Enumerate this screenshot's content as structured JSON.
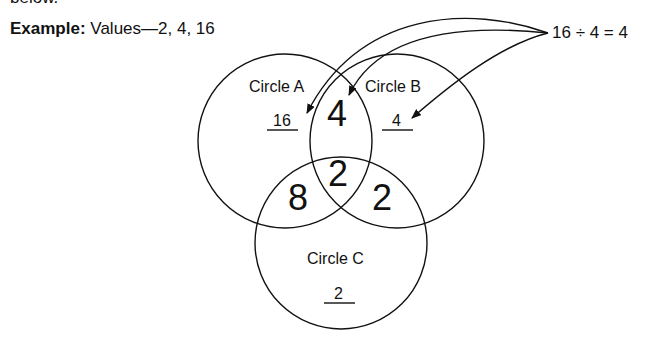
{
  "header": {
    "cut_text": "below.",
    "example_label": "Example:",
    "example_values": "Values—2, 4, 16"
  },
  "equation": "16 ÷ 4 = 4",
  "circles": [
    {
      "name": "Circle A",
      "value": "16"
    },
    {
      "name": "Circle B",
      "value": "4"
    },
    {
      "name": "Circle C",
      "value": "2"
    }
  ],
  "intersections": {
    "AB": "4",
    "ABC": "2",
    "AC": "8",
    "BC": "2"
  },
  "colors": {
    "stroke": "#111111",
    "background": "#ffffff"
  }
}
